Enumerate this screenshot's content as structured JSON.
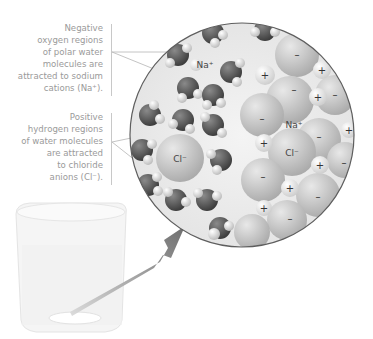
{
  "annotations": {
    "top": {
      "lines": [
        "Negative",
        "oxygen regions",
        "of polar water",
        "molecules are",
        "attracted to sodium",
        "cations (Na⁺)."
      ]
    },
    "bottom": {
      "lines": [
        "Positive",
        "hydrogen regions",
        "of water molecules",
        "are attracted",
        "to chloride",
        "anions (Cl⁻)."
      ]
    }
  },
  "inset_labels": {
    "na_hydrated": "Na⁺",
    "cl_hydrated": "Cl⁻",
    "na_crystal": "Na⁺",
    "cl_crystal": "Cl⁻",
    "plus": "+",
    "minus": "–"
  },
  "colors": {
    "text": "#9a9a9a",
    "oxygen": "#5a5a5a",
    "hydrogen": "#e6e6e6",
    "ion": "#c4c4c4",
    "arrow": "#7a7a7a",
    "circle_edge": "#5e5e5e"
  }
}
